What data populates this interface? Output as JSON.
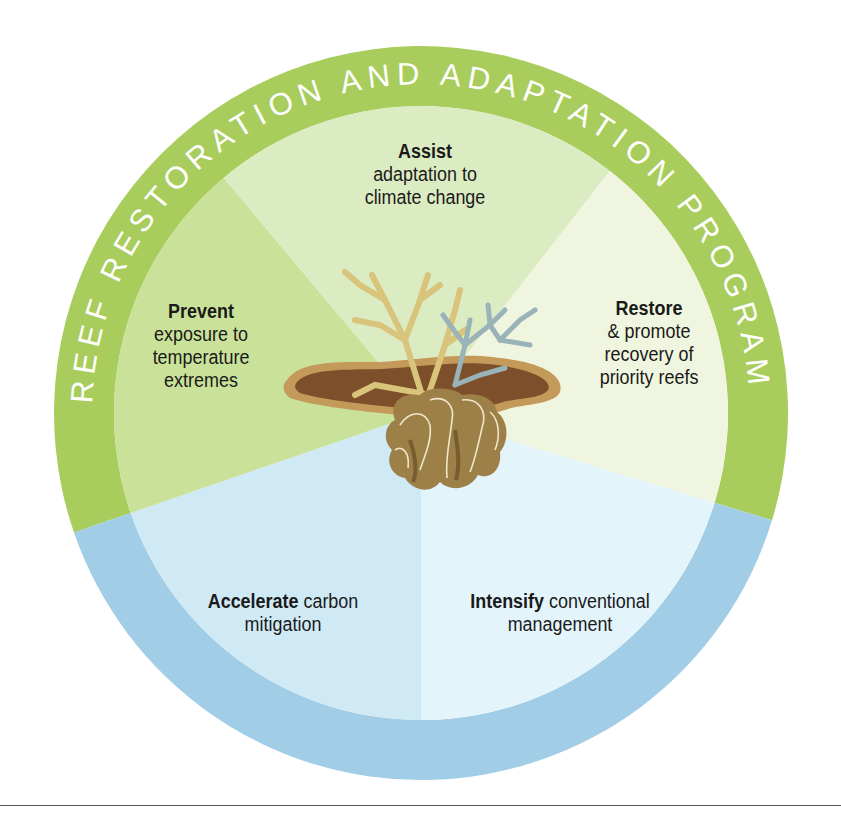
{
  "diagram": {
    "outer_ring": {
      "top_label": "REEF RESTORATION AND ADAPTATION PROGRAM",
      "bottom_label": "FOUNDATIONAL",
      "top_color": "#a9cd5c",
      "bottom_color": "#a1cde6"
    },
    "segments": [
      {
        "id": "assist",
        "bold": "Assist",
        "lines": [
          "adaptation to",
          "climate change"
        ],
        "color": "#dcecc2"
      },
      {
        "id": "restore",
        "bold": "Restore",
        "lines": [
          "& promote",
          "recovery of",
          "priority reefs"
        ],
        "color": "#eff5df"
      },
      {
        "id": "intensify",
        "bold": "Intensify",
        "rest": " conventional",
        "lines": [
          "management"
        ],
        "color": "#e3f4fa"
      },
      {
        "id": "accelerate",
        "bold": "Accelerate",
        "rest": " carbon",
        "lines": [
          "mitigation"
        ],
        "color": "#cfe9f5"
      },
      {
        "id": "prevent",
        "bold": "Prevent",
        "lines": [
          "exposure to",
          "temperature",
          "extremes"
        ],
        "color": "#c9e199"
      }
    ],
    "center_illustration": "coral-illustration"
  }
}
